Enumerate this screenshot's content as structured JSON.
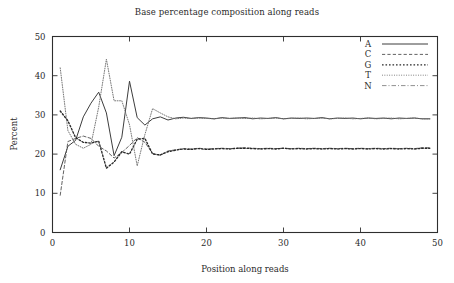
{
  "chart_data": {
    "type": "line",
    "title": "Base percentage composition along reads",
    "xlabel": "Position along reads",
    "ylabel": "Percent",
    "xlim": [
      0,
      50
    ],
    "ylim": [
      0,
      50
    ],
    "xticks": [
      0,
      10,
      20,
      30,
      40,
      50
    ],
    "yticks": [
      0,
      10,
      20,
      30,
      40,
      50
    ],
    "grid": false,
    "legend_position": "top-right",
    "x": [
      1,
      2,
      3,
      4,
      5,
      6,
      7,
      8,
      9,
      10,
      11,
      12,
      13,
      14,
      15,
      16,
      17,
      18,
      19,
      20,
      21,
      22,
      23,
      24,
      25,
      26,
      27,
      28,
      29,
      30,
      31,
      32,
      33,
      34,
      35,
      36,
      37,
      38,
      39,
      40,
      41,
      42,
      43,
      44,
      45,
      46,
      47,
      48,
      49
    ],
    "series": [
      {
        "name": "A",
        "style": "solid",
        "color": "#3d3d3d",
        "values": [
          16.0,
          22.0,
          23.5,
          29.5,
          33.0,
          35.8,
          30.5,
          19.6,
          24.3,
          38.6,
          29.3,
          27.4,
          29.0,
          29.5,
          28.7,
          29.2,
          29.4,
          29.1,
          29.3,
          29.2,
          29.0,
          29.3,
          29.1,
          29.2,
          29.3,
          29.0,
          29.2,
          29.1,
          29.3,
          29.0,
          29.2,
          29.1,
          29.2,
          29.1,
          29.3,
          29.0,
          29.2,
          29.1,
          29.2,
          29.0,
          29.2,
          29.1,
          29.2,
          29.0,
          29.2,
          29.1,
          29.2,
          29.0,
          29.0
        ]
      },
      {
        "name": "C",
        "style": "dashed",
        "color": "#5a5a5a",
        "values": [
          9.5,
          23.2,
          24.0,
          24.6,
          24.0,
          22.0,
          20.8,
          19.0,
          20.4,
          22.2,
          24.2,
          23.0,
          20.2,
          19.7,
          20.8,
          21.1,
          21.4,
          21.3,
          21.5,
          21.3,
          21.4,
          21.5,
          21.4,
          21.5,
          21.6,
          21.5,
          21.4,
          21.5,
          21.4,
          21.5,
          21.4,
          21.5,
          21.4,
          21.5,
          21.4,
          21.5,
          21.4,
          21.5,
          21.4,
          21.5,
          21.4,
          21.5,
          21.4,
          21.5,
          21.4,
          21.5,
          21.4,
          21.6,
          21.6
        ]
      },
      {
        "name": "G",
        "style": "dotted",
        "color": "#2a2a2a",
        "values": [
          31.0,
          28.5,
          24.2,
          23.0,
          22.8,
          23.3,
          16.4,
          18.0,
          20.6,
          20.0,
          23.8,
          24.0,
          20.0,
          19.8,
          20.6,
          21.0,
          21.3,
          21.2,
          21.4,
          21.2,
          21.3,
          21.4,
          21.3,
          21.5,
          21.5,
          21.4,
          21.3,
          21.4,
          21.3,
          21.5,
          21.3,
          21.4,
          21.3,
          21.4,
          21.3,
          21.4,
          21.3,
          21.4,
          21.3,
          21.4,
          21.3,
          21.4,
          21.3,
          21.4,
          21.3,
          21.4,
          21.3,
          21.5,
          21.5
        ]
      },
      {
        "name": "T",
        "style": "fine-dotted",
        "color": "#707070",
        "values": [
          42.0,
          26.0,
          22.5,
          21.5,
          22.5,
          32.0,
          44.2,
          33.6,
          33.6,
          27.5,
          17.0,
          25.0,
          31.6,
          30.5,
          29.5,
          29.0,
          29.2,
          29.1,
          29.2,
          29.1,
          29.0,
          29.2,
          29.1,
          29.2,
          29.1,
          29.2,
          29.0,
          29.1,
          29.2,
          29.0,
          29.1,
          29.2,
          29.0,
          29.1,
          29.2,
          29.0,
          29.1,
          29.2,
          29.0,
          29.1,
          29.2,
          29.0,
          29.1,
          29.2,
          29.0,
          29.1,
          29.2,
          29.0,
          29.0
        ]
      },
      {
        "name": "N",
        "style": "dash-dot",
        "color": "#8a8a8a",
        "values": [
          0.0,
          0.0,
          0.0,
          0.0,
          0.0,
          0.0,
          0.0,
          0.0,
          0.0,
          0.0,
          0.0,
          0.0,
          0.0,
          0.0,
          0.0,
          0.0,
          0.0,
          0.0,
          0.0,
          0.0,
          0.0,
          0.0,
          0.0,
          0.0,
          0.0,
          0.0,
          0.0,
          0.0,
          0.0,
          0.0,
          0.0,
          0.0,
          0.0,
          0.0,
          0.0,
          0.0,
          0.0,
          0.0,
          0.0,
          0.0,
          0.0,
          0.0,
          0.0,
          0.0,
          0.0,
          0.0,
          0.0,
          0.0,
          0.0
        ]
      }
    ]
  },
  "legend": {
    "entries": [
      {
        "label": "A"
      },
      {
        "label": "C"
      },
      {
        "label": "G"
      },
      {
        "label": "T"
      },
      {
        "label": "N"
      }
    ]
  }
}
